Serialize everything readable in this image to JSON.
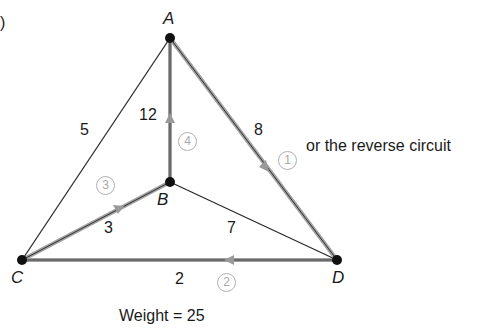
{
  "part_label": ")",
  "vertices": [
    {
      "id": "A",
      "label": "A"
    },
    {
      "id": "B",
      "label": "B"
    },
    {
      "id": "C",
      "label": "C"
    },
    {
      "id": "D",
      "label": "D"
    }
  ],
  "edges": [
    {
      "from": "A",
      "to": "C",
      "weight": "5",
      "in_circuit": false
    },
    {
      "from": "A",
      "to": "B",
      "weight": "12",
      "in_circuit": true,
      "step": "4"
    },
    {
      "from": "A",
      "to": "D",
      "weight": "8",
      "in_circuit": true,
      "step": "1"
    },
    {
      "from": "C",
      "to": "B",
      "weight": "3",
      "in_circuit": true,
      "step": "3"
    },
    {
      "from": "B",
      "to": "D",
      "weight": "7",
      "in_circuit": false
    },
    {
      "from": "D",
      "to": "C",
      "weight": "2",
      "in_circuit": true,
      "step": "2"
    }
  ],
  "annotation": "or the reverse circuit",
  "total": "Weight = 25",
  "colors": {
    "edge": "#2a2a2a",
    "circuit_edge": "#9a9a9a",
    "step_marker": "#a8a8a8",
    "vertex": "#111111"
  }
}
